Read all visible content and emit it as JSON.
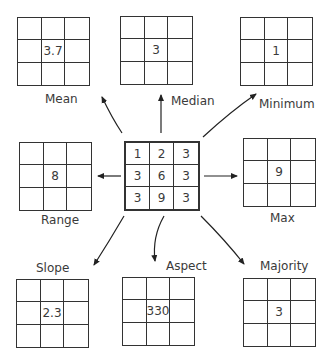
{
  "source": {
    "name": "input-grid",
    "cells": [
      "1",
      "2",
      "3",
      "3",
      "6",
      "3",
      "3",
      "9",
      "3"
    ]
  },
  "outputs": [
    {
      "id": "mean",
      "label": "Mean",
      "value": "3.7"
    },
    {
      "id": "median",
      "label": "Median",
      "value": "3"
    },
    {
      "id": "minimum",
      "label": "Minimum",
      "value": "1"
    },
    {
      "id": "range",
      "label": "Range",
      "value": "8"
    },
    {
      "id": "max",
      "label": "Max",
      "value": "9"
    },
    {
      "id": "slope",
      "label": "Slope",
      "value": "2.3"
    },
    {
      "id": "aspect",
      "label": "Aspect",
      "value": "330"
    },
    {
      "id": "majority",
      "label": "Majority",
      "value": "3"
    }
  ]
}
